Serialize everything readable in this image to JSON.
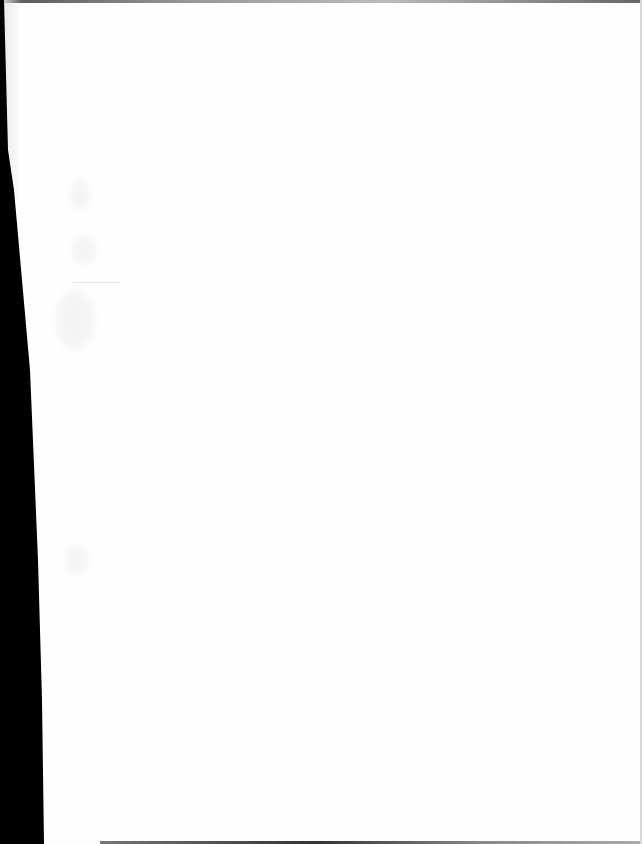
{
  "document": {
    "type": "scanned blank page",
    "visible_text": "",
    "colors": {
      "paper": "#fefefe",
      "scan_edge": "#000000"
    }
  }
}
